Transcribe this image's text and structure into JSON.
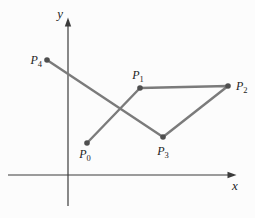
{
  "figure": {
    "background": "#fcfcfc",
    "canvas": {
      "width": 255,
      "height": 218
    },
    "colors": {
      "polyline": "#7b7b7b",
      "point": "#4f4f4f",
      "axis": "#3b3b3b",
      "label": "#1c1c1c"
    },
    "axes": {
      "x": {
        "label": "x",
        "from": [
          8,
          175
        ],
        "to": [
          234,
          175
        ],
        "label_pos": [
          235,
          190
        ],
        "label_anchor": "middle"
      },
      "y": {
        "label": "y",
        "from": [
          68,
          206
        ],
        "to": [
          68,
          20
        ],
        "label_pos": [
          63,
          18
        ],
        "label_anchor": "end"
      }
    },
    "points": [
      {
        "name": "P",
        "sub": "0",
        "x": 87,
        "y": 143,
        "label_pos": [
          85,
          158
        ],
        "label_anchor": "middle"
      },
      {
        "name": "P",
        "sub": "1",
        "x": 140,
        "y": 88,
        "label_pos": [
          138,
          79
        ],
        "label_anchor": "middle"
      },
      {
        "name": "P",
        "sub": "2",
        "x": 228,
        "y": 86,
        "label_pos": [
          236,
          90
        ],
        "label_anchor": "start"
      },
      {
        "name": "P",
        "sub": "3",
        "x": 163,
        "y": 137,
        "label_pos": [
          163,
          155
        ],
        "label_anchor": "middle"
      },
      {
        "name": "P",
        "sub": "4",
        "x": 47,
        "y": 60,
        "label_pos": [
          42,
          64
        ],
        "label_anchor": "end"
      }
    ],
    "path_order": [
      0,
      1,
      2,
      3,
      4
    ],
    "style": {
      "polyline_width": 2.4,
      "axis_width": 1.2,
      "point_radius": 2.8,
      "label_font_size": 12,
      "sub_font_size": 8.5,
      "axis_label_font_size": 13,
      "arrow_length": 9,
      "arrow_half_width": 3.2
    }
  }
}
